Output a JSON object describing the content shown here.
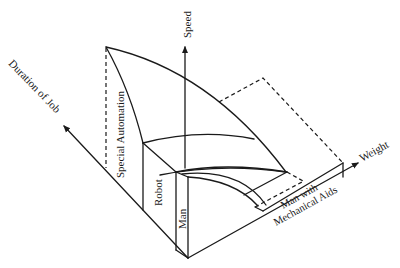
{
  "diagram": {
    "type": "3d-region-diagram",
    "axes": {
      "speed": "Speed",
      "duration": "Duration of Job",
      "weight": "Weight"
    },
    "regions": {
      "special_automation": "Special Automation",
      "robot": "Robot",
      "man": "Man",
      "man_with_aids_line1": "Man with",
      "man_with_aids_line2": "Mechanical Aids"
    },
    "colors": {
      "ink": "#1a1a1a",
      "background": "#ffffff"
    }
  }
}
